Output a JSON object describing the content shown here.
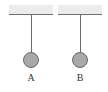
{
  "pendulums": [
    {
      "label": "A"
    },
    {
      "label": "B"
    }
  ],
  "colors": {
    "ceiling": "#ececec",
    "string": "#6a6a6a",
    "ball": "#a8a8a8"
  }
}
